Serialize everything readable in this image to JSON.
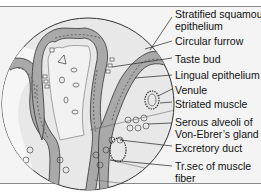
{
  "figure": {
    "labels": [
      {
        "id": "stratified-squamous",
        "line1": "Stratified squamous",
        "line2": "epithelium"
      },
      {
        "id": "circular-furrow",
        "line1": "Circular furrow"
      },
      {
        "id": "taste-bud",
        "line1": "Taste bud"
      },
      {
        "id": "lingual-epithelium",
        "line1": "Lingual epithelium"
      },
      {
        "id": "venule",
        "line1": "Venule"
      },
      {
        "id": "striated-muscle",
        "line1": "Striated muscle"
      },
      {
        "id": "serous-alveoli",
        "line1": "Serous alveoli of",
        "line2": "Von-Ebrer’s gland"
      },
      {
        "id": "excretory-duct",
        "line1": "Excretory duct"
      },
      {
        "id": "muscle-fiber",
        "line1": "Tr.sec of muscle",
        "line2": "fiber"
      }
    ]
  },
  "colors": {
    "epithelium": "#a9a9a9",
    "tissue": "#e6e6e6",
    "background": "#f4f4f4",
    "outline": "#333333"
  }
}
